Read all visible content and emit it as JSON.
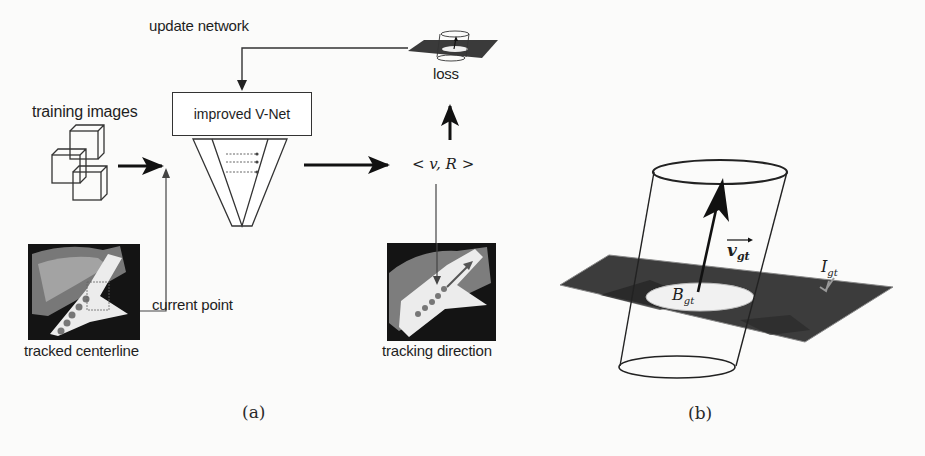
{
  "figure": {
    "panel_a": {
      "caption": "(a)",
      "labels": {
        "training_images": "training images",
        "network": "improved V-Net",
        "current_point": "current point",
        "tracked_centerline": "tracked centerline",
        "tracking_direction": "tracking direction",
        "update_network": "update network",
        "loss": "loss",
        "output": "< v, R >"
      }
    },
    "panel_b": {
      "caption": "(b)",
      "labels": {
        "vector": "v",
        "vector_sub": "gt",
        "ball": "B",
        "ball_sub": "gt",
        "image": "I",
        "image_sub": "gt"
      }
    }
  },
  "colors": {
    "background": "#fbfbfa",
    "ink": "#1e1e1e",
    "plane": "#3a3a3a",
    "vessel": "#e8e8e8"
  }
}
